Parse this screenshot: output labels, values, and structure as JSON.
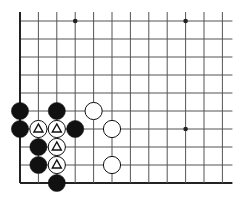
{
  "diagram": {
    "type": "go-board-fragment",
    "colors": {
      "background": "#ffffff",
      "line": "#555555",
      "edge": "#222222",
      "black": "#111111",
      "white": "#ffffff"
    },
    "grid": {
      "columns": 12,
      "rows": 10,
      "x0": 20,
      "y0": 21,
      "dx": 18.4,
      "dy": 18.0,
      "edges": {
        "left": true,
        "bottom": true,
        "top": false,
        "right": false
      }
    },
    "hoshi": [
      {
        "col": 3,
        "row": 0
      },
      {
        "col": 9,
        "row": 0
      },
      {
        "col": 9,
        "row": 6
      }
    ],
    "stones": [
      {
        "col": 0,
        "row": 5,
        "color": "black"
      },
      {
        "col": 2,
        "row": 5,
        "color": "black"
      },
      {
        "col": 4,
        "row": 5,
        "color": "white"
      },
      {
        "col": 0,
        "row": 6,
        "color": "black"
      },
      {
        "col": 1,
        "row": 6,
        "color": "white",
        "mark": "triangle"
      },
      {
        "col": 2,
        "row": 6,
        "color": "white",
        "mark": "triangle"
      },
      {
        "col": 3,
        "row": 6,
        "color": "black"
      },
      {
        "col": 5,
        "row": 6,
        "color": "white"
      },
      {
        "col": 1,
        "row": 7,
        "color": "black"
      },
      {
        "col": 2,
        "row": 7,
        "color": "white",
        "mark": "triangle"
      },
      {
        "col": 1,
        "row": 8,
        "color": "black"
      },
      {
        "col": 2,
        "row": 8,
        "color": "white",
        "mark": "triangle"
      },
      {
        "col": 5,
        "row": 8,
        "color": "white"
      },
      {
        "col": 2,
        "row": 9,
        "color": "black"
      }
    ]
  }
}
